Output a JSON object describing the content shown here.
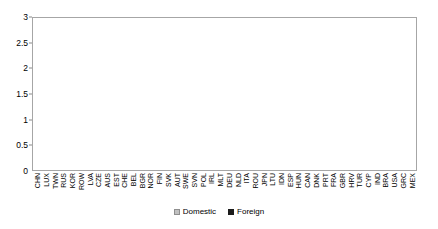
{
  "chart_data": {
    "type": "bar",
    "subtype": "stacked-bar",
    "title": "",
    "xlabel": "",
    "ylabel": "",
    "ylim": [
      0,
      3
    ],
    "yticks": [
      "0",
      "0.5",
      "1",
      "1.5",
      "2",
      "2.5",
      "3"
    ],
    "ytick_values": [
      0,
      0.5,
      1,
      1.5,
      2,
      2.5,
      3
    ],
    "grid": false,
    "legend_position": "bottom-center",
    "legend": [
      "Domestic",
      "Foreign"
    ],
    "colors": {
      "domestic": "#c0c0c0",
      "foreign": "#1c1c1c",
      "axis": "#a6a6a6",
      "text": "#000000",
      "background": "#ffffff"
    },
    "categories": [
      "CHN",
      "LUX",
      "TWN",
      "RUS",
      "KOR",
      "ROW",
      "LVA",
      "CZE",
      "AUS",
      "EST",
      "CHE",
      "BEL",
      "BGR",
      "NOR",
      "FIN",
      "SVK",
      "AUT",
      "SWE",
      "SVN",
      "POL",
      "IRL",
      "MLT",
      "DEU",
      "NLD",
      "ITA",
      "ROU",
      "JPN",
      "LTU",
      "IDN",
      "ESP",
      "HUN",
      "CAN",
      "DNK",
      "PRT",
      "FRA",
      "GBR",
      "HRV",
      "TUR",
      "CYP",
      "IND",
      "BRA",
      "USA",
      "GRC",
      "MEX"
    ],
    "series": [
      {
        "name": "Domestic",
        "values": [
          2.62,
          1.43,
          1.65,
          1.84,
          1.89,
          1.8,
          1.9,
          1.84,
          1.83,
          1.85,
          1.56,
          1.6,
          1.6,
          1.61,
          1.62,
          1.61,
          1.72,
          1.62,
          1.6,
          1.61,
          1.38,
          1.37,
          1.72,
          1.62,
          1.71,
          1.6,
          1.79,
          1.55,
          1.79,
          1.69,
          1.53,
          1.62,
          1.57,
          1.61,
          1.64,
          1.66,
          1.53,
          1.69,
          1.33,
          1.74,
          1.78,
          1.76,
          1.66,
          1.42
        ]
      },
      {
        "name": "Foreign",
        "values": [
          0.22,
          1.22,
          0.97,
          0.65,
          0.56,
          0.66,
          0.52,
          0.56,
          0.54,
          0.5,
          0.74,
          0.67,
          0.66,
          0.64,
          0.63,
          0.63,
          0.51,
          0.6,
          0.62,
          0.6,
          0.82,
          0.82,
          0.47,
          0.56,
          0.47,
          0.57,
          0.38,
          0.61,
          0.36,
          0.45,
          0.6,
          0.5,
          0.54,
          0.49,
          0.45,
          0.42,
          0.54,
          0.37,
          0.72,
          0.3,
          0.25,
          0.25,
          0.32,
          0.33
        ]
      }
    ],
    "totals": [
      2.84,
      2.65,
      2.62,
      2.49,
      2.45,
      2.46,
      2.42,
      2.4,
      2.37,
      2.35,
      2.3,
      2.27,
      2.26,
      2.25,
      2.25,
      2.24,
      2.23,
      2.22,
      2.22,
      2.21,
      2.2,
      2.19,
      2.19,
      2.18,
      2.18,
      2.17,
      2.17,
      2.16,
      2.15,
      2.14,
      2.13,
      2.12,
      2.11,
      2.1,
      2.09,
      2.08,
      2.07,
      2.06,
      2.05,
      2.04,
      2.03,
      2.01,
      1.98,
      1.75
    ]
  }
}
